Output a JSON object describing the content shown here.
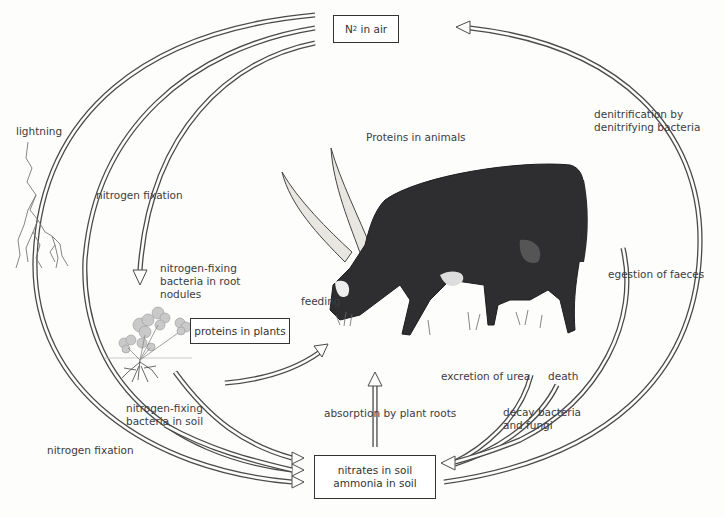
{
  "diagram": {
    "nodes": {
      "n2_air": {
        "prefix": "N",
        "subscript": "2",
        "suffix": " in air"
      },
      "proteins_plants": "proteins in plants",
      "proteins_animals": "Proteins in animals",
      "soil_line1": "nitrates in soil",
      "soil_line2": "ammonia in soil"
    },
    "labels": {
      "lightning": "lightning",
      "nitrogen_fixation_upper": "nitrogen fixation",
      "root_nodules_1": "nitrogen-fixing",
      "root_nodules_2": "bacteria in root",
      "root_nodules_3": "nodules",
      "feeding": "feeding",
      "soil_bacteria_1": "nitrogen-fixing",
      "soil_bacteria_2": "bacteria in soil",
      "nitrogen_fixation_lower": "nitrogen fixation",
      "absorption": "absorption by plant roots",
      "excretion": "excretion of urea",
      "death": "death",
      "decay_1": "decay bacteria",
      "decay_2": "and fungi",
      "egestion": "egestion of faeces",
      "denitrification_1": "denitrification by",
      "denitrification_2": "denitrifying bacteria"
    },
    "illustrations": [
      "lightning-bolt",
      "clover-plant",
      "ankole-cattle"
    ],
    "colors": {
      "line": "#4a4a4a",
      "text": "#3c3c3c",
      "cow_body": "#2e2e30",
      "horn": "#e8e6e0",
      "plant": "#b8b8b8"
    }
  }
}
